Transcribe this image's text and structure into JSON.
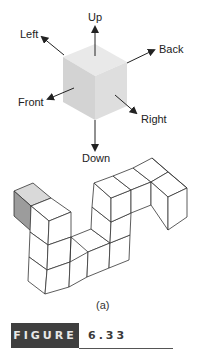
{
  "figure": {
    "number_label": "FIGURE",
    "number": "6.33",
    "subcaption": "(a)"
  },
  "direction_cube": {
    "labels": {
      "up": "Up",
      "down": "Down",
      "left": "Left",
      "right": "Right",
      "front": "Front",
      "back": "Back"
    },
    "colors": {
      "top_face": "#e6e6e6",
      "left_face": "#d2d2d2",
      "right_face": "#dcdcdc",
      "arrow": "#222222"
    }
  },
  "block_structure": {
    "highlighted_cube_top": "#d9d9d9",
    "highlighted_cube_side": "#9a9a9a",
    "line_color": "#333333"
  }
}
